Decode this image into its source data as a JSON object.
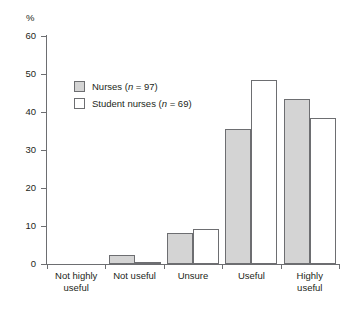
{
  "chart_data": {
    "type": "bar",
    "title": "",
    "xlabel": "",
    "ylabel": "%",
    "ylim": [
      0,
      60
    ],
    "yticks": [
      0,
      10,
      20,
      30,
      40,
      50,
      60
    ],
    "grid": false,
    "legend_position": "upper-left-inside",
    "categories": [
      "Not highly useful",
      "Not useful",
      "Unsure",
      "Useful",
      "Highly useful"
    ],
    "category_lines": [
      [
        "Not highly",
        "useful"
      ],
      [
        "Not useful",
        ""
      ],
      [
        "Unsure",
        ""
      ],
      [
        "Useful",
        ""
      ],
      [
        "Highly",
        "useful"
      ]
    ],
    "series": [
      {
        "name": "Nurses",
        "n": 97,
        "legend_label": "Nurses (n = 97)",
        "color": "#d4d4d4",
        "values": [
          0,
          2.5,
          8.2,
          35.5,
          43.5
        ]
      },
      {
        "name": "Student nurses",
        "n": 69,
        "legend_label": "Student nurses (n = 69)",
        "color": "#ffffff",
        "values": [
          0,
          0.6,
          9.3,
          48.3,
          38.5
        ]
      }
    ]
  },
  "axis": {
    "percent_symbol": "%",
    "tick_labels": [
      "60",
      "50",
      "40",
      "30",
      "20",
      "10",
      "0"
    ]
  },
  "legend": {
    "rows": [
      {
        "label_main": "Nurses (",
        "label_italic": "n",
        "label_tail": " = 97)"
      },
      {
        "label_main": "Student nurses (",
        "label_italic": "n",
        "label_tail": " = 69)"
      }
    ]
  },
  "colors": {
    "axis": "#6d6e71",
    "bar_fill_nurses": "#d4d4d4",
    "bar_fill_students": "#ffffff",
    "text": "#231f20"
  }
}
